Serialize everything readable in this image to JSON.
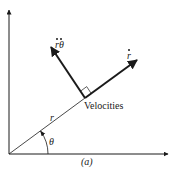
{
  "figure": {
    "caption": "(a)",
    "colors": {
      "ink": "#1a1a1a",
      "background": "#ffffff"
    }
  },
  "labels": {
    "radius": "r",
    "angle": "θ",
    "radial_velocity": "r",
    "transverse_velocity_r": "r",
    "transverse_velocity_theta": "θ",
    "velocities": "Velocities"
  },
  "geometry": {
    "origin": [
      9,
      154
    ],
    "y_axis_end": [
      9,
      8
    ],
    "x_axis_end": [
      170,
      154
    ],
    "point_p": [
      85,
      98
    ],
    "radial_velocity_tip": [
      139,
      59
    ],
    "transverse_velocity_tip": [
      49,
      44
    ]
  }
}
